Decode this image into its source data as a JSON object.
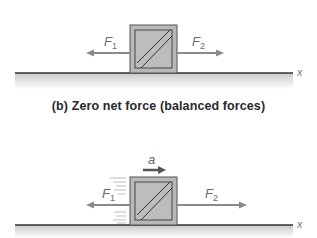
{
  "colors": {
    "box_fill": "#b4b4b4",
    "box_stroke": "#555555",
    "arrow": "#8a8a8a",
    "accel_arrow": "#555555",
    "ground_line": "#333333",
    "ground_shade": "#d0d0d0",
    "label": "#6a6a6a",
    "caption": "#2a2a2a"
  },
  "panel_b": {
    "caption": "(b) Zero net force (balanced forces)",
    "forces": [
      {
        "name": "F",
        "subscript": "1",
        "direction": "left"
      },
      {
        "name": "F",
        "subscript": "2",
        "direction": "right"
      }
    ],
    "axis_label": "x"
  },
  "panel_c": {
    "acceleration_label": "a",
    "forces": [
      {
        "name": "F",
        "subscript": "1",
        "direction": "left"
      },
      {
        "name": "F",
        "subscript": "2",
        "direction": "right"
      }
    ],
    "axis_label": "x"
  }
}
